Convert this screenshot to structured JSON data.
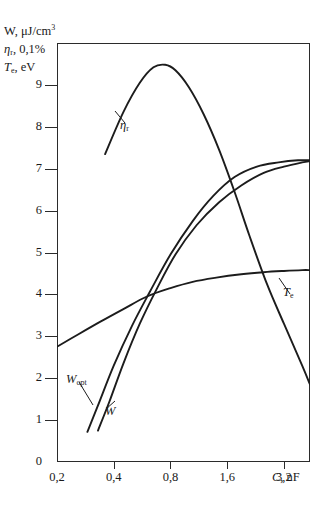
{
  "chart_data": {
    "type": "line",
    "title": "",
    "ylabel_lines": [
      {
        "id": "w",
        "text": "W, μJ/cm",
        "sup": "3",
        "sub": ""
      },
      {
        "id": "eta",
        "text": "η",
        "sub": "r",
        "rest": ", 0,1%"
      },
      {
        "id": "te",
        "text": "T",
        "sub": "e",
        "rest": ", eV"
      }
    ],
    "xlabel": "C, nF",
    "x_tick_labels": [
      "0,2",
      "0,4",
      "0,8",
      "1,6",
      "3,2"
    ],
    "x_tick_values": [
      0.2,
      0.4,
      0.8,
      1.6,
      3.2
    ],
    "x_scale": "log2",
    "xlim": [
      0.2,
      4.4
    ],
    "y_tick_labels": [
      "0",
      "1",
      "2",
      "3",
      "4",
      "5",
      "6",
      "7",
      "8",
      "9"
    ],
    "y_tick_values": [
      0,
      1,
      2,
      3,
      4,
      5,
      6,
      7,
      8,
      9
    ],
    "ylim": [
      0,
      10
    ],
    "grid": false,
    "legend_position": "inline-annotations",
    "series": [
      {
        "name": "ηr",
        "label": "η",
        "label_sub": "r",
        "annotation_x": 120,
        "annotation_y": 118,
        "x": [
          0.36,
          0.45,
          0.55,
          0.65,
          0.75,
          0.85,
          1.0,
          1.2,
          1.45,
          1.75,
          2.1,
          2.6,
          3.2,
          4.0,
          4.4
        ],
        "y": [
          7.35,
          8.35,
          9.05,
          9.42,
          9.48,
          9.35,
          8.95,
          8.3,
          7.45,
          6.45,
          5.4,
          4.25,
          3.3,
          2.3,
          1.85
        ]
      },
      {
        "name": "Wopt",
        "label": "W",
        "label_sub": "opt",
        "annotation_x": 66,
        "annotation_y": 372,
        "x": [
          0.29,
          0.33,
          0.4,
          0.5,
          0.62,
          0.8,
          1.05,
          1.35,
          1.75,
          2.3,
          3.0,
          3.8,
          4.4
        ],
        "y": [
          0.72,
          1.35,
          2.3,
          3.25,
          4.05,
          4.95,
          5.75,
          6.35,
          6.8,
          7.05,
          7.15,
          7.2,
          7.2
        ]
      },
      {
        "name": "W",
        "label": "W",
        "label_sub": "",
        "annotation_x": 105,
        "annotation_y": 404,
        "x": [
          0.33,
          0.38,
          0.45,
          0.55,
          0.68,
          0.85,
          1.1,
          1.45,
          1.9,
          2.5,
          3.2,
          4.0,
          4.4
        ],
        "y": [
          0.75,
          1.45,
          2.35,
          3.3,
          4.15,
          4.95,
          5.65,
          6.2,
          6.6,
          6.9,
          7.05,
          7.15,
          7.18
        ]
      },
      {
        "name": "Te",
        "label": "T",
        "label_sub": "e",
        "annotation_x": 283,
        "annotation_y": 285,
        "x": [
          0.2,
          0.26,
          0.34,
          0.45,
          0.6,
          0.8,
          1.05,
          1.4,
          1.9,
          2.5,
          3.2,
          4.0,
          4.4
        ],
        "y": [
          2.75,
          3.05,
          3.35,
          3.65,
          3.95,
          4.15,
          4.3,
          4.4,
          4.48,
          4.53,
          4.56,
          4.58,
          4.58
        ]
      }
    ]
  },
  "annotations": {
    "eta_tag": "η",
    "eta_tag_sub": "r",
    "wopt_tag": "W",
    "wopt_tag_sub": "opt",
    "w_tag": "W",
    "te_tag": "T",
    "te_tag_sub": "e",
    "axis_title_w": "W, μJ/cm",
    "axis_title_w_sup": "3",
    "axis_title_eta": "η",
    "axis_title_eta_sub": "r",
    "axis_title_eta_rest": ", 0,1%",
    "axis_title_te": "T",
    "axis_title_te_sub": "e",
    "axis_title_te_rest": ", eV",
    "axis_title_x": "C",
    "axis_title_x_rest": ", nF"
  }
}
